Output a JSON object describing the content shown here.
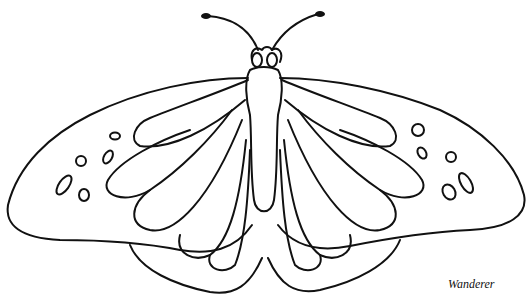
{
  "image": {
    "subject": "butterfly line drawing",
    "caption": "Wanderer",
    "stroke_color": "#111111",
    "background_color": "#ffffff"
  }
}
